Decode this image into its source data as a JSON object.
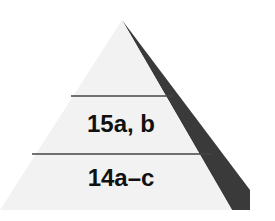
{
  "diagram": {
    "type": "pyramid",
    "tiers": [
      {
        "position": "top",
        "label": ""
      },
      {
        "position": "middle",
        "label": "15a, b"
      },
      {
        "position": "bottom",
        "label": "14a–c"
      }
    ],
    "colors": {
      "face": "#f2f2f2",
      "shadow": "#3a3a3a",
      "divider": "#444444",
      "text": "#111111"
    }
  }
}
